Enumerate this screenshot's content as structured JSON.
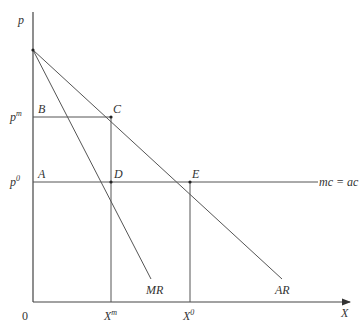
{
  "diagram": {
    "axes": {
      "y_label": "p",
      "x_label": "X",
      "origin_label": "0"
    },
    "price_labels": {
      "pm": {
        "base": "p",
        "sup": "m"
      },
      "p0": {
        "base": "p",
        "sup": "0"
      }
    },
    "quantity_labels": {
      "xm": {
        "base": "X",
        "sup": "m"
      },
      "x0": {
        "base": "X",
        "sup": "0"
      }
    },
    "points": {
      "A": "A",
      "B": "B",
      "C": "C",
      "D": "D",
      "E": "E"
    },
    "curves": {
      "mr": "MR",
      "ar": "AR",
      "mc": "mc = ac"
    },
    "colors": {
      "line": "#555555",
      "text": "#333333",
      "background": "#ffffff"
    }
  }
}
